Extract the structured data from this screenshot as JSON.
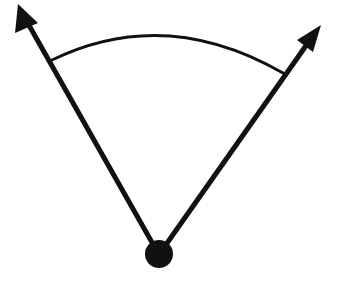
{
  "diagram": {
    "type": "angle",
    "colors": {
      "background": "#ffffff",
      "stroke": "#111111"
    },
    "vertex": {
      "cx": 159,
      "cy": 254,
      "r": 14
    },
    "rays": [
      {
        "name": "left-ray",
        "x1": 154,
        "y1": 246,
        "x2": 26,
        "y2": 20,
        "arrowhead": "18,4 15,33 38,23"
      },
      {
        "name": "right-ray",
        "x1": 165,
        "y1": 246,
        "x2": 310,
        "y2": 40,
        "arrowhead": "321,25 297,40 313,52"
      }
    ],
    "arc": {
      "path": "M 52 60 Q 165 5 283 73"
    },
    "labels": []
  }
}
